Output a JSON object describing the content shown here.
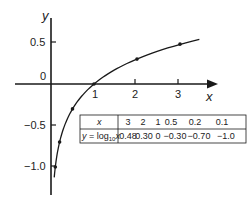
{
  "chart_data": {
    "type": "line",
    "title": "",
    "function": "y = log10(x)",
    "xlabel": "x",
    "ylabel": "y",
    "xticks": [
      1,
      2,
      3
    ],
    "xtick_labels": [
      "1",
      "2",
      "3"
    ],
    "yticks": [
      0.5,
      0,
      -0.5,
      -1.0
    ],
    "ytick_labels": [
      "0.5",
      "0",
      "−0.5",
      "−1.0"
    ],
    "xlim": [
      -0.2,
      4.0
    ],
    "ylim": [
      -1.4,
      0.95
    ],
    "grid": false,
    "legend": null,
    "series": [
      {
        "name": "y = log10 x",
        "x": [
          0.1,
          0.2,
          0.5,
          1,
          2,
          3
        ],
        "y": [
          -1.0,
          -0.7,
          -0.3,
          0,
          0.3,
          0.48
        ]
      }
    ],
    "table": {
      "row_headers": [
        "x",
        "y = log10x"
      ],
      "x_values": [
        "3",
        "2",
        "1",
        "0.5",
        "0.2",
        "0.1"
      ],
      "y_values": [
        "0.48",
        "0.30",
        "0",
        "−0.30",
        "−0.70",
        "−1.0"
      ]
    }
  },
  "labels": {
    "x_axis": "x",
    "y_axis": "y",
    "origin": "0",
    "y_half": "0.5",
    "y_neg_half": "−0.5",
    "y_neg_one": "−1.0",
    "x_one": "1",
    "x_two": "2",
    "x_three": "3",
    "table_x_header": "x",
    "table_y_header_prefix": "y = log",
    "table_y_header_sub": "10",
    "table_y_header_suffix": "x"
  },
  "colors": {
    "ink": "#1a1a1a",
    "background": "#ffffff"
  }
}
